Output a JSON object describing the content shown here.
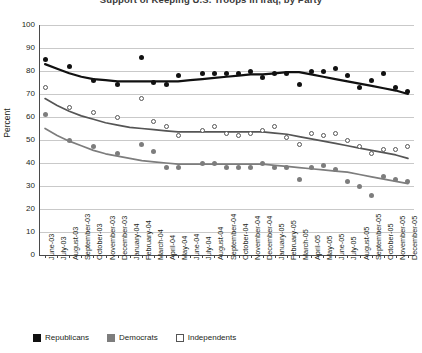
{
  "chart_data": {
    "type": "scatter",
    "title": "Support of Keeping U.S. Troops in Iraq, by Party",
    "xlabel": "",
    "ylabel": "Percent",
    "ylim": [
      0,
      100
    ],
    "ytick_step": 10,
    "yticks": [
      100,
      90,
      80,
      70,
      60,
      50,
      40,
      30,
      20,
      10,
      0
    ],
    "grid": true,
    "legend_position": "bottom-left",
    "categories": [
      "June-03",
      "July-03",
      "August-03",
      "September-03",
      "October-03",
      "November-03",
      "December-03",
      "January-04",
      "February-04",
      "March-04",
      "April-04",
      "May-04",
      "June-04",
      "July-04",
      "August-04",
      "September-04",
      "October-04",
      "November-04",
      "December-04",
      "January-05",
      "February-05",
      "March-05",
      "April-05",
      "May-05",
      "June-05",
      "July-05",
      "August-05",
      "September-05",
      "October-05",
      "November-05",
      "December-05"
    ],
    "series": [
      {
        "name": "Republicans",
        "color": "#111111",
        "marker": "filled-circle",
        "values": [
          85,
          null,
          82,
          null,
          76,
          null,
          74,
          null,
          86,
          75,
          74,
          78,
          null,
          79,
          79,
          79,
          79,
          80,
          77,
          79,
          79,
          74,
          80,
          80,
          81,
          78,
          73,
          76,
          79,
          73,
          71
        ],
        "trend": [
          83,
          81,
          79,
          77.5,
          76.5,
          76,
          75.5,
          75.5,
          75.5,
          75.5,
          75.5,
          75.5,
          76,
          76.5,
          77,
          77.5,
          78,
          78.5,
          78.5,
          79,
          79.5,
          79.5,
          78.5,
          77.5,
          76.5,
          75.5,
          74.5,
          73.5,
          72.5,
          71.5,
          70
        ]
      },
      {
        "name": "Independents",
        "color": "#555555",
        "marker": "open-circle",
        "values": [
          73,
          null,
          64,
          null,
          62,
          null,
          60,
          null,
          68,
          58,
          56,
          52,
          null,
          54,
          56,
          53,
          52,
          53,
          54,
          56,
          51,
          48,
          53,
          52,
          53,
          50,
          47,
          44,
          46,
          46,
          47
        ],
        "trend": [
          68,
          65,
          62.5,
          60.5,
          59,
          57.5,
          56.5,
          55.5,
          55,
          54.5,
          54,
          53.5,
          53.5,
          53.5,
          53.5,
          53.5,
          53.5,
          53.5,
          53.5,
          53,
          52.5,
          51.5,
          50.5,
          49.5,
          48.5,
          47.5,
          46.5,
          45.5,
          44.5,
          43.5,
          42
        ]
      },
      {
        "name": "Democrats",
        "color": "#7d7d7d",
        "marker": "filled-circle",
        "values": [
          61,
          null,
          50,
          null,
          47,
          null,
          44,
          null,
          48,
          45,
          38,
          38,
          null,
          40,
          40,
          38,
          38,
          38,
          40,
          38,
          38,
          33,
          38,
          39,
          37,
          32,
          30,
          26,
          34,
          33,
          32
        ],
        "trend": [
          55,
          52,
          49.5,
          47.5,
          45.5,
          44,
          43,
          42,
          41,
          40.5,
          40,
          39.5,
          39.5,
          39.5,
          39.5,
          39.5,
          39.5,
          39.5,
          39.5,
          39,
          38.5,
          38,
          37.5,
          37,
          36.5,
          36,
          35,
          34,
          33,
          32,
          31
        ]
      }
    ],
    "legend": [
      {
        "label": "Republicans",
        "swatch": "filled-black-square"
      },
      {
        "label": "Democrats",
        "swatch": "filled-gray-square"
      },
      {
        "label": "Independents",
        "swatch": "open-white-square"
      }
    ],
    "colors": {
      "republicans": "#111111",
      "democrats": "#7d7d7d",
      "independents": "#555555",
      "grid": "#c9c9c9",
      "axis": "#4a4a4a"
    }
  },
  "plot_geometry": {
    "left": 39,
    "right": 414,
    "top": 25,
    "bottom": 255
  }
}
